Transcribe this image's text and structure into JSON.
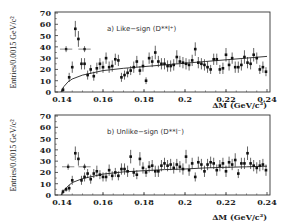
{
  "chart_data": [
    {
      "type": "scatter",
      "panel": "a",
      "title": "a) Like-sign (D**l+)",
      "panel_label": "a) Like−sign (D**l⁺)",
      "xlabel": "ΔM (GeV/c²)",
      "ylabel": "Entries/0.0015 GeV/c²",
      "xlim": [
        0.14,
        0.24
      ],
      "ylim": [
        0,
        70
      ],
      "xticks": [
        0.14,
        0.16,
        0.18,
        0.2,
        0.22,
        0.24
      ],
      "xtick_labels": [
        "0.14",
        "0.16",
        "0.18",
        "0.2",
        "0.22",
        "0.24"
      ],
      "yticks": [
        0,
        10,
        20,
        30,
        40,
        50,
        60,
        70
      ],
      "ytick_labels": [
        "0",
        "10",
        "20",
        "30",
        "40",
        "50",
        "60",
        "70"
      ],
      "grid": false,
      "series": [
        {
          "name": "data",
          "style": "points-with-error-bars",
          "x": [
            0.1405,
            0.1435,
            0.145,
            0.1465,
            0.148,
            0.1495,
            0.151,
            0.1525,
            0.154,
            0.1555,
            0.157,
            0.1585,
            0.16,
            0.1615,
            0.163,
            0.1645,
            0.166,
            0.1675,
            0.169,
            0.1705,
            0.172,
            0.1735,
            0.175,
            0.1765,
            0.178,
            0.1795,
            0.181,
            0.1825,
            0.184,
            0.1855,
            0.187,
            0.1885,
            0.19,
            0.1915,
            0.193,
            0.1945,
            0.196,
            0.1975,
            0.199,
            0.2005,
            0.202,
            0.2035,
            0.205,
            0.2065,
            0.208,
            0.2095,
            0.211,
            0.2125,
            0.214,
            0.2155,
            0.217,
            0.2185,
            0.22,
            0.2215,
            0.223,
            0.2245,
            0.226,
            0.2275,
            0.229,
            0.2305,
            0.232,
            0.2335,
            0.235,
            0.2365,
            0.238,
            0.2395
          ],
          "y": [
            2,
            13,
            22,
            56,
            47,
            25,
            25,
            15,
            20,
            14,
            21,
            25,
            22,
            30,
            22,
            23,
            29,
            28,
            13,
            15,
            17,
            19,
            22,
            27,
            19,
            23,
            10,
            30,
            27,
            35,
            27,
            25,
            25,
            23,
            23,
            24,
            31,
            27,
            26,
            25,
            24,
            28,
            38,
            26,
            25,
            24,
            22,
            20,
            29,
            29,
            20,
            21,
            33,
            24,
            30,
            22,
            22,
            24,
            31,
            26,
            25,
            33,
            30,
            20,
            22,
            18
          ],
          "yerr": [
            2,
            4,
            5,
            7,
            7,
            5,
            5,
            4,
            4,
            4,
            5,
            5,
            5,
            5,
            5,
            5,
            5,
            5,
            4,
            4,
            4,
            4,
            5,
            5,
            4,
            5,
            3,
            5,
            5,
            6,
            5,
            5,
            5,
            5,
            5,
            5,
            6,
            5,
            5,
            5,
            5,
            5,
            6,
            5,
            5,
            5,
            5,
            4,
            5,
            5,
            4,
            5,
            6,
            5,
            5,
            5,
            5,
            5,
            6,
            5,
            5,
            6,
            5,
            4,
            5,
            4
          ]
        },
        {
          "name": "wide-bin data",
          "style": "points-with-horizontal-bars",
          "x": [
            0.142,
            0.151
          ],
          "xerr": [
            0.003,
            0.003
          ],
          "y": [
            38,
            38
          ]
        },
        {
          "name": "fit",
          "style": "line",
          "x": [
            0.1395,
            0.141,
            0.143,
            0.145,
            0.15,
            0.16,
            0.17,
            0.18,
            0.19,
            0.2,
            0.21,
            0.22,
            0.23,
            0.24
          ],
          "y": [
            0,
            5,
            9,
            11.5,
            15,
            19,
            21,
            22.5,
            24,
            25.5,
            27,
            28.5,
            30,
            31.5
          ]
        }
      ]
    },
    {
      "type": "scatter",
      "panel": "b",
      "title": "b) Unlike-sign (D**l-)",
      "panel_label": "b) Unlike−sign (D**l⁻)",
      "xlabel": "ΔM (GeV/c²)",
      "ylabel": "Entries/0.0015 GeV/c²",
      "xlim": [
        0.14,
        0.24
      ],
      "ylim": [
        0,
        70
      ],
      "xticks": [
        0.14,
        0.16,
        0.18,
        0.2,
        0.22,
        0.24
      ],
      "xtick_labels": [
        "0.14",
        "0.16",
        "0.18",
        "0.2",
        "0.22",
        "0.24"
      ],
      "yticks": [
        0,
        10,
        20,
        30,
        40,
        50,
        60,
        70
      ],
      "ytick_labels": [
        "0",
        "10",
        "20",
        "30",
        "40",
        "50",
        "60",
        "70"
      ],
      "grid": false,
      "series": [
        {
          "name": "data",
          "style": "points-with-error-bars",
          "x": [
            0.1405,
            0.142,
            0.1435,
            0.145,
            0.1465,
            0.148,
            0.1495,
            0.151,
            0.1525,
            0.154,
            0.1555,
            0.157,
            0.1585,
            0.16,
            0.1615,
            0.163,
            0.1645,
            0.166,
            0.1675,
            0.169,
            0.1705,
            0.172,
            0.1735,
            0.175,
            0.1765,
            0.178,
            0.1795,
            0.181,
            0.1825,
            0.184,
            0.1855,
            0.187,
            0.1885,
            0.19,
            0.1915,
            0.193,
            0.1945,
            0.196,
            0.1975,
            0.199,
            0.2005,
            0.202,
            0.2035,
            0.205,
            0.2065,
            0.208,
            0.2095,
            0.211,
            0.2125,
            0.214,
            0.2155,
            0.217,
            0.2185,
            0.22,
            0.2215,
            0.223,
            0.2245,
            0.226,
            0.2275,
            0.229,
            0.2305,
            0.232,
            0.2335,
            0.235,
            0.2365,
            0.238,
            0.2395
          ],
          "y": [
            3,
            5,
            6,
            13,
            37,
            32,
            13,
            16,
            19,
            14,
            19,
            21,
            18,
            16,
            16,
            22,
            17,
            20,
            17,
            23,
            23,
            21,
            34,
            20,
            18,
            32,
            24,
            20,
            25,
            26,
            21,
            21,
            26,
            28,
            26,
            27,
            24,
            27,
            25,
            23,
            34,
            22,
            28,
            16,
            29,
            27,
            21,
            27,
            29,
            28,
            22,
            26,
            28,
            21,
            29,
            27,
            31,
            19,
            28,
            28,
            37,
            28,
            26,
            24,
            26,
            27,
            22
          ],
          "yerr": [
            2,
            2,
            3,
            4,
            6,
            6,
            4,
            4,
            4,
            4,
            4,
            5,
            4,
            4,
            4,
            5,
            4,
            4,
            4,
            5,
            5,
            5,
            6,
            4,
            4,
            6,
            5,
            4,
            5,
            5,
            5,
            5,
            5,
            5,
            5,
            5,
            5,
            5,
            5,
            5,
            6,
            5,
            5,
            4,
            5,
            5,
            5,
            5,
            5,
            5,
            5,
            5,
            5,
            5,
            5,
            5,
            6,
            4,
            5,
            5,
            6,
            5,
            5,
            5,
            5,
            5,
            5
          ]
        },
        {
          "name": "wide-bin data",
          "style": "points-with-horizontal-bars",
          "x": [
            0.143,
            0.151
          ],
          "xerr": [
            0.003,
            0.003
          ],
          "y": [
            25,
            25
          ]
        },
        {
          "name": "fit",
          "style": "line",
          "x": [
            0.1395,
            0.141,
            0.143,
            0.145,
            0.15,
            0.16,
            0.17,
            0.18,
            0.19,
            0.2,
            0.21,
            0.22,
            0.23,
            0.24
          ],
          "y": [
            0,
            4,
            8,
            11,
            14.5,
            18.5,
            20.5,
            21.5,
            22.5,
            23,
            24,
            24.5,
            25,
            25.5
          ]
        }
      ]
    }
  ],
  "figure": {
    "panels": [
      {
        "label": "a) Like−sign (D**l⁺)",
        "xlabel": "ΔM (GeV/c²)",
        "ylabel": "Entries/0.0015 GeV/c²"
      },
      {
        "label": "b) Unlike−sign (D**l⁻)",
        "xlabel": "ΔM (GeV/c²)",
        "ylabel": "Entries/0.0015 GeV/c²"
      }
    ]
  }
}
